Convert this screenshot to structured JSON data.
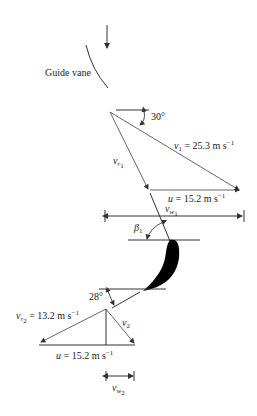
{
  "diagram": {
    "type": "velocity-triangles-turbine-blade",
    "guide_vane": {
      "label": "Guide vane"
    },
    "inlet_triangle": {
      "angle_label": "30°",
      "v1": {
        "symbol": "v",
        "sub": "1",
        "value": "= 25.3 m s",
        "exp": "−1"
      },
      "vr1": {
        "symbol": "v",
        "sub": "r",
        "subsub": "1"
      },
      "u": {
        "symbol": "u",
        "value": "= 15.2 m s",
        "exp": "−1"
      }
    },
    "whirl_inlet": {
      "symbol": "v",
      "sub": "w",
      "subsub": "1"
    },
    "blade_inlet_angle": {
      "symbol": "β",
      "sub": "1"
    },
    "outlet_triangle": {
      "angle_label": "28°",
      "vr2": {
        "symbol": "v",
        "sub": "r",
        "subsub": "2",
        "value": "= 13.2 m s",
        "exp": "−1"
      },
      "v2": {
        "symbol": "v",
        "sub": "2"
      },
      "u": {
        "symbol": "u",
        "value": "= 15.2 m s",
        "exp": "−1"
      }
    },
    "whirl_outlet": {
      "symbol": "v",
      "sub": "w",
      "subsub": "2"
    },
    "colors": {
      "line": "#333333",
      "blade": "#000000",
      "background": "#ffffff"
    }
  }
}
